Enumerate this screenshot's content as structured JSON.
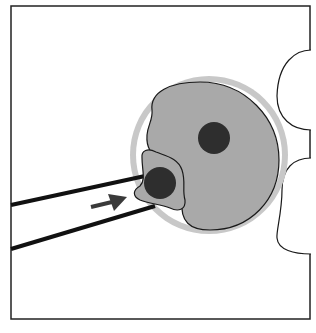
{
  "diagram": {
    "title": "",
    "colors": {
      "background": "#ffffff",
      "frame": "#222222",
      "zona": "#c8c8c8",
      "cytoplasm": "#a9a9a9",
      "nucleus": "#2e2e2e",
      "outline": "#1a1a1a",
      "arrow": "#3a3a3a"
    },
    "elements": [
      {
        "id": "frame",
        "label": ""
      },
      {
        "id": "holding-cells",
        "label": ""
      },
      {
        "id": "zona-pellucida",
        "label": ""
      },
      {
        "id": "oocyte",
        "label": ""
      },
      {
        "id": "oocyte-nucleus",
        "label": ""
      },
      {
        "id": "donor-cell",
        "label": ""
      },
      {
        "id": "donor-nucleus",
        "label": ""
      },
      {
        "id": "micropipette",
        "label": ""
      },
      {
        "id": "injection-arrow",
        "label": ""
      }
    ]
  }
}
